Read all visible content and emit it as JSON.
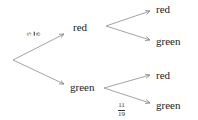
{
  "diagram": {
    "type": "probability-tree",
    "level1": {
      "top": {
        "label": "red",
        "probability": {
          "numerator": "5",
          "denominator": "8"
        }
      },
      "bottom": {
        "label": "green"
      }
    },
    "level2": {
      "from_red": {
        "top": {
          "label": "red"
        },
        "bottom": {
          "label": "green"
        }
      },
      "from_green": {
        "top": {
          "label": "red"
        },
        "bottom": {
          "label": "green",
          "probability": {
            "numerator": "11",
            "denominator": "19"
          }
        }
      }
    }
  },
  "colors": {
    "line": "#888888",
    "text": "#222222"
  }
}
